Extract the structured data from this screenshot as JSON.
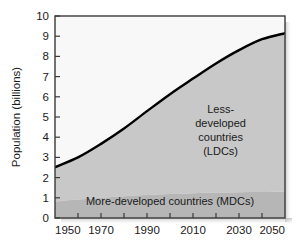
{
  "chart_data": {
    "type": "area",
    "title": "",
    "subtitle": "",
    "xlabel": "",
    "ylabel": "Population (billions)",
    "xlim": [
      1950,
      2050
    ],
    "ylim": [
      0,
      10
    ],
    "grid": false,
    "legend_position": "inside-annotations",
    "x_ticks": [
      1950,
      1970,
      1990,
      2010,
      2030,
      2050
    ],
    "x_tick_labels": [
      "1950",
      "1970",
      "1990",
      "2010",
      "2030",
      "2050"
    ],
    "x_minor_ticks": [
      1950,
      1960,
      1970,
      1980,
      1990,
      2000,
      2010,
      2020,
      2030,
      2040,
      2050
    ],
    "y_ticks": [
      0,
      1,
      2,
      3,
      4,
      5,
      6,
      7,
      8,
      9,
      10
    ],
    "y_tick_labels": [
      "0",
      "1",
      "2",
      "3",
      "4",
      "5",
      "6",
      "7",
      "8",
      "9",
      "10"
    ],
    "x": [
      1950,
      1960,
      1970,
      1980,
      1990,
      2000,
      2010,
      2020,
      2030,
      2040,
      2050
    ],
    "series": [
      {
        "name": "More-developed countries (MDCs)",
        "values": [
          0.81,
          0.91,
          1.0,
          1.08,
          1.14,
          1.19,
          1.23,
          1.26,
          1.28,
          1.29,
          1.3
        ],
        "color": "#b6b6b6"
      },
      {
        "name": "Less-developed countries (LDCs)",
        "values": [
          1.71,
          2.09,
          2.67,
          3.35,
          4.15,
          4.94,
          5.67,
          6.39,
          7.03,
          7.56,
          7.85
        ],
        "color": "#c8c8c8"
      }
    ],
    "total_line": {
      "name": "World total population",
      "values": [
        2.52,
        3.0,
        3.67,
        4.43,
        5.29,
        6.13,
        6.9,
        7.65,
        8.31,
        8.85,
        9.15
      ],
      "color": "#000000"
    },
    "annotations": [
      {
        "name": "ldc-annotation",
        "lines": [
          "Less-",
          "developed",
          "countries",
          "(LDCs)"
        ],
        "x": 2022,
        "y": 5.2
      },
      {
        "name": "mdc-annotation",
        "lines": [
          "More-developed countries (MDCs)"
        ],
        "x": 2000,
        "y": 0.62
      }
    ],
    "colors": {
      "plot_background_upper": "#f8f8f8",
      "ldc_fill": "#c8c8c8",
      "mdc_fill": "#b6b6b6",
      "curve": "#000000",
      "axis": "#3a3a3a",
      "text": "#1a1a1a"
    }
  },
  "axes": {
    "y_axis_title": "Population (billions)"
  }
}
